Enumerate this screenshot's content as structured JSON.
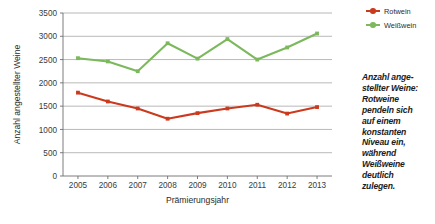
{
  "chart_data": {
    "type": "line",
    "title": "",
    "xlabel": "Prämierungsjahr",
    "ylabel": "Anzahl angestellter Weine",
    "categories": [
      "2005",
      "2006",
      "2007",
      "2008",
      "2009",
      "2010",
      "2011",
      "2012",
      "2013"
    ],
    "ylim": [
      0,
      3500
    ],
    "yticks": [
      "0",
      "500",
      "1000",
      "1500",
      "2000",
      "2500",
      "3000",
      "3500"
    ],
    "ytick_values": [
      0,
      500,
      1000,
      1500,
      2000,
      2500,
      3000,
      3500
    ],
    "grid": "horizontal",
    "legend_position": "top-right",
    "series": [
      {
        "name": "Rotwein",
        "color": "#CC3A1E",
        "values": [
          1790,
          1600,
          1450,
          1230,
          1350,
          1450,
          1530,
          1340,
          1480
        ]
      },
      {
        "name": "Weißwein",
        "color": "#7CB85C",
        "values": [
          2530,
          2460,
          2250,
          2850,
          2520,
          2940,
          2500,
          2760,
          3060
        ]
      }
    ]
  },
  "legend": {
    "items": [
      {
        "label": "Rotwein",
        "color": "#CC3A1E"
      },
      {
        "label": "Weißwein",
        "color": "#7CB85C"
      }
    ]
  },
  "caption": {
    "lines": [
      "Anzahl ange-",
      "stellter Weine:",
      "Rotweine",
      "pendeln sich",
      "auf einem",
      "konstanten",
      "Niveau ein,",
      "während",
      "Weißweine",
      "deutlich",
      "zulegen."
    ]
  }
}
